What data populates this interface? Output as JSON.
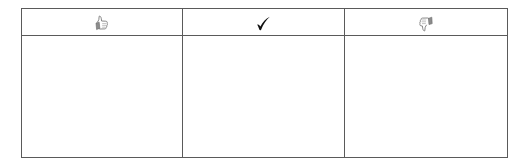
{
  "table": {
    "columns": [
      {
        "key": "like",
        "icon": "thumbs-up-icon",
        "label": "",
        "color": "#7a7a7a"
      },
      {
        "key": "check",
        "icon": "check-mark-icon",
        "label": "",
        "color": "#111111"
      },
      {
        "key": "dislike",
        "icon": "thumbs-down-icon",
        "label": "",
        "color": "#7a7a7a"
      }
    ],
    "rows": [
      [
        "",
        "",
        ""
      ]
    ],
    "border_color": "#5a5a5a"
  }
}
